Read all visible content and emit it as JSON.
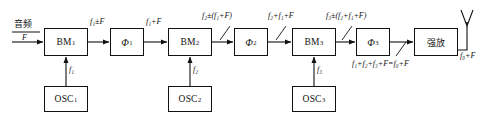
{
  "diagram": {
    "stroke_color": "#111111",
    "background": "#ffffff"
  },
  "blocks": [
    {
      "id": "bm1",
      "name": "BM",
      "sub": "1",
      "kind": "balanced-modulator",
      "x": 44,
      "y": 28,
      "w": 44,
      "h": 28
    },
    {
      "id": "phi1",
      "name": "Φ",
      "sub": "1",
      "kind": "filter",
      "x": 110,
      "y": 28,
      "w": 34,
      "h": 28
    },
    {
      "id": "bm2",
      "name": "BM",
      "sub": "2",
      "kind": "balanced-modulator",
      "x": 168,
      "y": 28,
      "w": 44,
      "h": 28
    },
    {
      "id": "phi2",
      "name": "Φ",
      "sub": "2",
      "kind": "filter",
      "x": 234,
      "y": 28,
      "w": 34,
      "h": 28
    },
    {
      "id": "bm3",
      "name": "BM",
      "sub": "3",
      "kind": "balanced-modulator",
      "x": 292,
      "y": 28,
      "w": 44,
      "h": 28
    },
    {
      "id": "phi3",
      "name": "Φ",
      "sub": "3",
      "kind": "filter",
      "x": 356,
      "y": 28,
      "w": 34,
      "h": 28
    },
    {
      "id": "pa",
      "name": "强放",
      "sub": "",
      "kind": "power-amplifier",
      "x": 414,
      "y": 28,
      "w": 44,
      "h": 28
    }
  ],
  "oscillators": [
    {
      "id": "osc1",
      "name": "OSC",
      "sub": "1",
      "x": 44,
      "y": 86,
      "w": 44,
      "h": 26,
      "feed_label_base": "f",
      "feed_label_sub": "1"
    },
    {
      "id": "osc2",
      "name": "OSC",
      "sub": "2",
      "x": 168,
      "y": 86,
      "w": 44,
      "h": 26,
      "feed_label_base": "f",
      "feed_label_sub": "2"
    },
    {
      "id": "osc3",
      "name": "OSC",
      "sub": "3",
      "x": 292,
      "y": 86,
      "w": 44,
      "h": 26,
      "feed_label_base": "f",
      "feed_label_sub": "3"
    }
  ],
  "labels": {
    "input_cn": "音频",
    "input_sym": "F",
    "stage1_out": "f₁±F",
    "stage1_filtered": "f₁+F",
    "stage2_out": "f₂±(f₁+F)",
    "stage2_filtered": "f₂+f₁+F",
    "stage3_out": "f₃±(f₂+f₁+F)",
    "stage3_filtered_formula": "f₁+f₂+f₃+F=f₀+F",
    "antenna_out": "f₀+F",
    "osc1_feed": "f₁",
    "osc2_feed": "f₂",
    "osc3_feed": "f₃"
  },
  "antenna": {
    "name": "antenna",
    "apex_x": 467,
    "apex_y": 10
  }
}
